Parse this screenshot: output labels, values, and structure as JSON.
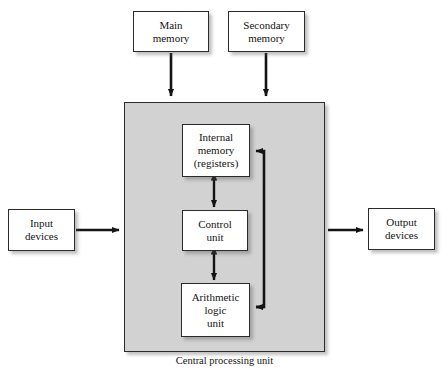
{
  "diagram": {
    "caption": "Central processing unit",
    "colors": {
      "cpu_background": "#d2d2d2",
      "box_fill": "#ffffff",
      "stroke": "#2b2b2b",
      "text": "#141414"
    },
    "boxes": [
      {
        "id": "main-memory",
        "line1": "Main",
        "line2": "memory"
      },
      {
        "id": "secondary-memory",
        "line1": "Secondary",
        "line2": "memory"
      },
      {
        "id": "internal-memory",
        "line1": "Internal",
        "line2": "memory",
        "line3": "(registers)"
      },
      {
        "id": "control-unit",
        "line1": "Control",
        "line2": "unit"
      },
      {
        "id": "alu",
        "line1": "Arithmetic",
        "line2": "logic",
        "line3": "unit"
      },
      {
        "id": "input-devices",
        "line1": "Input",
        "line2": "devices"
      },
      {
        "id": "output-devices",
        "line1": "Output",
        "line2": "devices"
      }
    ],
    "connections": [
      {
        "from": "main-memory",
        "to": "central-processing-unit",
        "heads": "single"
      },
      {
        "from": "secondary-memory",
        "to": "central-processing-unit",
        "heads": "single"
      },
      {
        "from": "input-devices",
        "to": "central-processing-unit",
        "heads": "single"
      },
      {
        "from": "central-processing-unit",
        "to": "output-devices",
        "heads": "single"
      },
      {
        "from": "internal-memory",
        "to": "control-unit",
        "heads": "double"
      },
      {
        "from": "control-unit",
        "to": "alu",
        "heads": "double"
      },
      {
        "from": "alu",
        "to": "internal-memory",
        "heads": "single",
        "route": "right-feedback-bus"
      }
    ]
  }
}
